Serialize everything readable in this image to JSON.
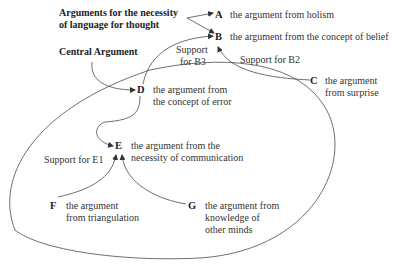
{
  "headings": {
    "necessity_line1": "Arguments for the necessity",
    "necessity_line2": "of language for thought",
    "central": "Central Argument"
  },
  "nodes": {
    "A": {
      "letter": "A",
      "text": [
        "the argument from holism"
      ]
    },
    "B": {
      "letter": "B",
      "text": [
        "the argument from the concept of belief"
      ]
    },
    "C": {
      "letter": "C",
      "text": [
        "the argument",
        "from surprise"
      ]
    },
    "D": {
      "letter": "D",
      "text": [
        "the argument from",
        "the concept of error"
      ]
    },
    "E": {
      "letter": "E",
      "text": [
        "the argument from the",
        "necessity of communication"
      ]
    },
    "F": {
      "letter": "F",
      "text": [
        "the argument",
        "from triangulation"
      ]
    },
    "G": {
      "letter": "G",
      "text": [
        "the argument from",
        "knowledge of",
        "other minds"
      ]
    }
  },
  "edge_labels": {
    "support_b3_line1": "Support",
    "support_b3_line2": "for B3",
    "support_b2": "Support for B2",
    "support_e1": "Support for E1"
  },
  "colors": {
    "line": "#4a4a4a",
    "text": "#333333"
  }
}
